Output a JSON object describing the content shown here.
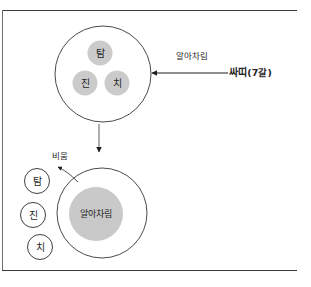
{
  "page": {
    "background_color": "#ffffff",
    "rule_color": "#3a3a3a",
    "circle_stroke_color": "#4a4a4a",
    "blob_fill_color": "#c9c9c9",
    "text_color": "#262626"
  },
  "top_diagram": {
    "outer_circle_name": "mind-circle",
    "defilements": [
      {
        "key": "tam",
        "label": "탐"
      },
      {
        "key": "jin",
        "label": "진"
      },
      {
        "key": "chi",
        "label": "치"
      }
    ]
  },
  "arrow_awareness": {
    "label": "알아차림",
    "source_label": "싸띠",
    "source_suffix": "(7갈)",
    "direction": "left"
  },
  "arrow_transform": {
    "direction": "down"
  },
  "bottom_diagram": {
    "outer_circle_name": "mind-circle",
    "inner_label": "알아차림",
    "emptying_label": "비움",
    "released": [
      {
        "key": "tam",
        "label": "탐"
      },
      {
        "key": "jin",
        "label": "진"
      },
      {
        "key": "chi",
        "label": "치"
      }
    ]
  }
}
